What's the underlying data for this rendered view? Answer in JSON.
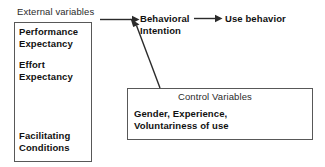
{
  "diagram": {
    "external": {
      "caption": "External variables",
      "items": [
        {
          "line1": "Performance",
          "line2": "Expectancy"
        },
        {
          "line1": "Effort",
          "line2": "Expectancy"
        },
        {
          "line1": "Facilitating",
          "line2": "Conditions"
        }
      ]
    },
    "nodes": {
      "behavioral_intention_line1": "Behavioral",
      "behavioral_intention_line2": "Intention",
      "use_behavior": "Use behavior"
    },
    "control": {
      "title": "Control Variables",
      "line1": "Gender,     Experience,",
      "line2": "Voluntariness of use"
    },
    "arrows": [
      {
        "name": "external-to-behavioral-intention",
        "from": "External variables",
        "to": "Behavioral Intention"
      },
      {
        "name": "control-to-behavioral-intention",
        "from": "Control Variables",
        "to": "Behavioral Intention"
      },
      {
        "name": "behavioral-intention-to-use-behavior",
        "from": "Behavioral Intention",
        "to": "Use behavior"
      }
    ],
    "colors": {
      "background": "#ffffff",
      "text": "#111111",
      "light_text": "#2b2b2b",
      "border": "#585858",
      "arrow": "#2b2b2b"
    }
  }
}
